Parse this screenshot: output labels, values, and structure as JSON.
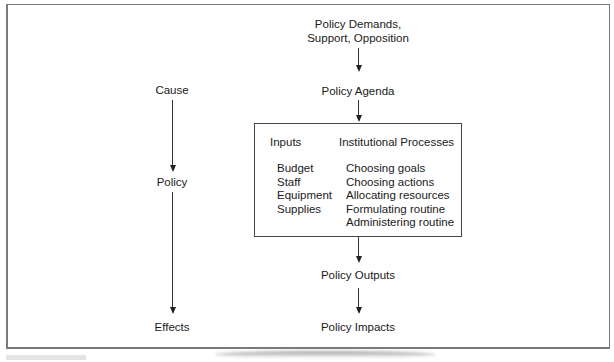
{
  "diagram": {
    "left_chain": {
      "cause": "Cause",
      "policy": "Policy",
      "effects": "Effects"
    },
    "right_chain": {
      "demands_line1": "Policy Demands,",
      "demands_line2": "Support, Opposition",
      "agenda": "Policy Agenda",
      "outputs": "Policy Outputs",
      "impacts": "Policy Impacts"
    },
    "process_box": {
      "inputs_header": "Inputs",
      "processes_header": "Institutional Processes",
      "inputs": [
        "Budget",
        "Staff",
        "Equipment",
        "Supplies"
      ],
      "processes": [
        "Choosing goals",
        "Choosing actions",
        "Allocating resources",
        "Formulating routine",
        "Administering routine"
      ]
    }
  }
}
